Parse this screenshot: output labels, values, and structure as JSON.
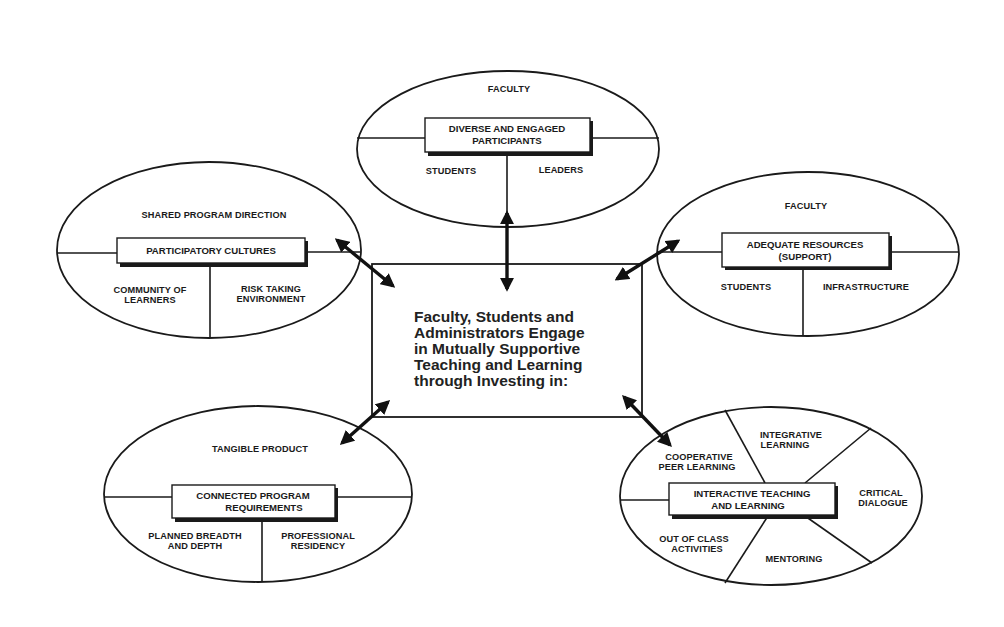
{
  "center": {
    "lines": [
      "Faculty, Students and",
      "Administrators Engage",
      "in Mutually Supportive",
      "Teaching and Learning",
      "through Investing in:"
    ]
  },
  "nodes": {
    "top": {
      "title_lines": [
        "DIVERSE AND ENGAGED",
        "PARTICIPANTS"
      ],
      "upper": "FACULTY",
      "lower_left": "STUDENTS",
      "lower_right": "LEADERS"
    },
    "left": {
      "title_lines": [
        "PARTICIPATORY CULTURES"
      ],
      "upper": "SHARED PROGRAM DIRECTION",
      "lower_left_lines": [
        "COMMUNITY OF",
        "LEARNERS"
      ],
      "lower_right_lines": [
        "RISK TAKING",
        "ENVIRONMENT"
      ]
    },
    "right": {
      "title_lines": [
        "ADEQUATE RESOURCES",
        "(SUPPORT)"
      ],
      "upper": "FACULTY",
      "lower_left": "STUDENTS",
      "lower_right": "INFRASTRUCTURE"
    },
    "bottom_left": {
      "title_lines": [
        "CONNECTED PROGRAM",
        "REQUIREMENTS"
      ],
      "upper": "TANGIBLE PRODUCT",
      "lower_left_lines": [
        "PLANNED BREADTH",
        "AND DEPTH"
      ],
      "lower_right_lines": [
        "PROFESSIONAL",
        "RESIDENCY"
      ]
    },
    "bottom_right": {
      "title_lines": [
        "INTERACTIVE TEACHING",
        "AND LEARNING"
      ],
      "segments": {
        "cooperative": [
          "COOPERATIVE",
          "PEER LEARNING"
        ],
        "integrative": [
          "INTEGRATIVE",
          "LEARNING"
        ],
        "critical": [
          "CRITICAL",
          "DIALOGUE"
        ],
        "mentoring": [
          "MENTORING"
        ],
        "out_of_class": [
          "OUT OF CLASS",
          "ACTIVITIES"
        ]
      }
    }
  },
  "connections": [
    {
      "from": "center",
      "to": "top",
      "type": "bidirectional"
    },
    {
      "from": "center",
      "to": "left",
      "type": "bidirectional"
    },
    {
      "from": "center",
      "to": "right",
      "type": "bidirectional"
    },
    {
      "from": "center",
      "to": "bottom_left",
      "type": "bidirectional"
    },
    {
      "from": "center",
      "to": "bottom_right",
      "type": "bidirectional"
    }
  ],
  "colors": {
    "ink": "#1a1a1a",
    "background": "#ffffff"
  }
}
